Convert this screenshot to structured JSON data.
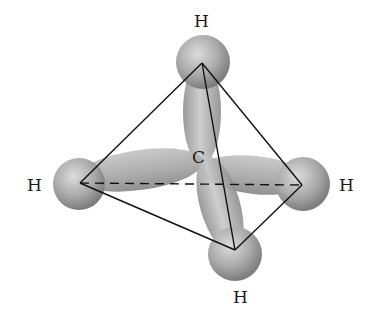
{
  "center_atom": {
    "label": "C",
    "x": 200,
    "y": 157
  },
  "hydrogens": [
    {
      "label": "H",
      "position": "top",
      "label_x": 192,
      "label_y": 12,
      "vertex_x": 202,
      "vertex_y": 63
    },
    {
      "label": "H",
      "position": "left",
      "label_x": 28,
      "label_y": 176,
      "vertex_x": 80,
      "vertex_y": 183
    },
    {
      "label": "H",
      "position": "right",
      "label_x": 340,
      "label_y": 176,
      "vertex_x": 302,
      "vertex_y": 185
    },
    {
      "label": "H",
      "position": "bottom",
      "label_x": 233,
      "label_y": 288,
      "vertex_x": 235,
      "vertex_y": 250
    }
  ],
  "colors": {
    "line": "#111111",
    "orbital": "#a8a8a8",
    "sphere": "#9a9a9a",
    "text": "#1a1a1a"
  }
}
